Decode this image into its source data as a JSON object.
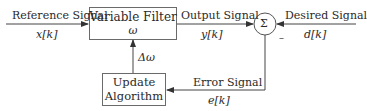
{
  "diagram": {
    "blocks": {
      "variable_filter": {
        "title": "Variable Filter",
        "param": "ω"
      },
      "update_algorithm": {
        "line1": "Update",
        "line2": "Algorithm"
      },
      "summer": {
        "symbol": "Σ",
        "minus_sign": "–"
      }
    },
    "signals": {
      "reference": {
        "label": "Reference Signal",
        "symbol": "x[k]"
      },
      "output": {
        "label": "Output Signal",
        "symbol": "y[k]"
      },
      "desired": {
        "label": "Desired Signal",
        "symbol": "d[k]"
      },
      "error": {
        "label": "Error Signal",
        "symbol": "e[k]"
      },
      "update": {
        "symbol": "Δω"
      }
    },
    "colors": {
      "line": "#444444",
      "text": "#2a2a2a",
      "box_border": "#6a6a6a"
    }
  }
}
